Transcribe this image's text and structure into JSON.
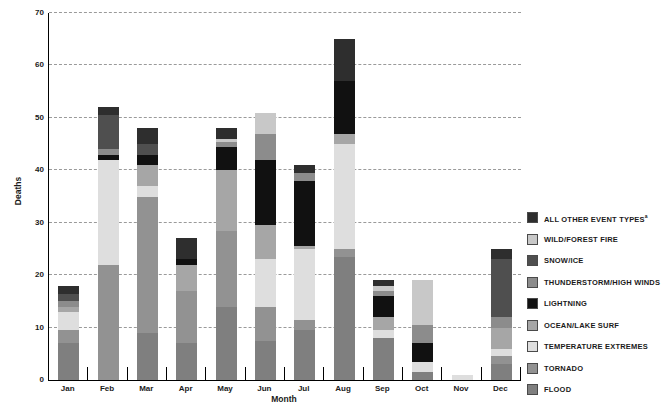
{
  "chart_data": {
    "type": "bar",
    "stacked": true,
    "title": "",
    "xlabel": "Month",
    "ylabel": "Deaths",
    "ylim": [
      0,
      70
    ],
    "yticks": [
      0,
      10,
      20,
      30,
      40,
      50,
      60,
      70
    ],
    "grid": "dashed horizontal gridlines at each 10",
    "legend_position": "right",
    "categories": [
      "Jan",
      "Feb",
      "Mar",
      "Apr",
      "May",
      "Jun",
      "Jul",
      "Aug",
      "Sep",
      "Oct",
      "Nov",
      "Dec"
    ],
    "series_note": "series listed bottom-to-top of stack; legend shows reverse order",
    "series": [
      {
        "name": "FLOOD",
        "color": "#7f7f7f",
        "values": [
          7,
          0,
          9,
          7,
          14,
          7.5,
          9.5,
          23.5,
          8,
          1.5,
          0,
          3
        ]
      },
      {
        "name": "TORNADO",
        "color": "#929292",
        "values": [
          2.5,
          22,
          26,
          10,
          14.5,
          6.5,
          2,
          1.5,
          0,
          0,
          0,
          1.5
        ]
      },
      {
        "name": "TEMPERATURE EXTREMES",
        "color": "#dedede",
        "values": [
          3.5,
          20,
          2,
          0,
          0,
          9,
          13.5,
          20,
          1.5,
          2,
          1,
          1.5
        ]
      },
      {
        "name": "OCEAN/LAKE SURF",
        "color": "#a6a6a6",
        "values": [
          1,
          0,
          4,
          5,
          11.5,
          6.5,
          0.5,
          2,
          2.5,
          0,
          0,
          4
        ]
      },
      {
        "name": "LIGHTNING",
        "color": "#111111",
        "values": [
          0,
          1,
          2,
          1,
          4.5,
          12.5,
          12.5,
          10,
          4,
          3.5,
          0,
          0
        ]
      },
      {
        "name": "THUNDERSTORM/HIGH WINDS",
        "color": "#8c8c8c",
        "values": [
          1,
          1,
          0,
          0,
          1,
          5,
          1.5,
          0,
          1,
          3.5,
          0,
          2
        ]
      },
      {
        "name": "SNOW/ICE",
        "color": "#4f4f4f",
        "values": [
          1.5,
          6.5,
          2,
          0,
          0,
          0,
          0,
          0,
          0,
          0,
          0,
          11
        ]
      },
      {
        "name": "WILD/FOREST FIRE",
        "color": "#c8c8c8",
        "values": [
          0,
          0,
          0,
          0,
          0.5,
          4,
          0,
          0,
          1,
          8.5,
          0,
          0
        ]
      },
      {
        "name": "ALL OTHER EVENT TYPES",
        "color": "#2e2e2e",
        "sup": "a",
        "values": [
          1.5,
          1.5,
          3,
          4,
          2,
          0,
          1.5,
          8,
          1,
          0,
          0,
          2
        ]
      }
    ],
    "monthly_totals": [
      18,
      52,
      48,
      27,
      48,
      51,
      41,
      65,
      19,
      19,
      1,
      25
    ]
  }
}
